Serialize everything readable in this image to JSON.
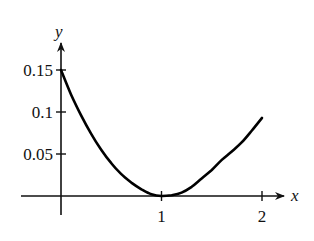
{
  "chart_data": {
    "type": "line",
    "title": "",
    "xlabel": "x",
    "ylabel": "y",
    "xlim": [
      0,
      2
    ],
    "ylim": [
      0,
      0.15
    ],
    "grid": false,
    "legend": null,
    "x_ticks": [
      {
        "value": 1,
        "label": "1"
      },
      {
        "value": 2,
        "label": "2"
      }
    ],
    "y_ticks": [
      {
        "value": 0.05,
        "label": "0.05"
      },
      {
        "value": 0.1,
        "label": "0.1"
      },
      {
        "value": 0.15,
        "label": "0.15"
      }
    ],
    "series": [
      {
        "name": "curve",
        "x": [
          0,
          0.1,
          0.2,
          0.3,
          0.4,
          0.5,
          0.6,
          0.7,
          0.8,
          0.9,
          1.0,
          1.1,
          1.2,
          1.3,
          1.4,
          1.5,
          1.6,
          1.7,
          1.8,
          1.9,
          2.0
        ],
        "y": [
          0.15,
          0.121,
          0.096,
          0.074,
          0.055,
          0.039,
          0.026,
          0.016,
          0.008,
          0.002,
          0.0,
          0.001,
          0.004,
          0.011,
          0.021,
          0.031,
          0.043,
          0.053,
          0.064,
          0.078,
          0.093
        ]
      }
    ]
  },
  "axes": {
    "x_label": "x",
    "y_label": "y"
  }
}
